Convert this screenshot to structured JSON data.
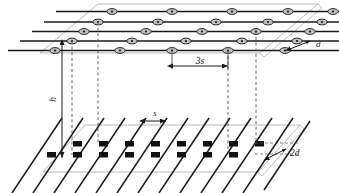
{
  "figure": {
    "type": "technical-line-diagram",
    "width": 339,
    "height": 193,
    "background_color": "#ffffff"
  },
  "labels": {
    "height": "h",
    "upper_spacing": "3s",
    "lower_spacing": "s",
    "upper_thickness": "d",
    "lower_thickness": "2d"
  },
  "colors": {
    "line_dark": "#1a1a1a",
    "line_plane_outline": "#a8a8a8",
    "marker_fill_upper": "#bfbfbf",
    "marker_fill_lower": "#111111",
    "dashed": "#555555"
  },
  "upper_plane": {
    "name": "upper-array-plane",
    "row_count": 5,
    "markers_per_row": [
      5,
      5,
      5,
      5,
      5
    ],
    "marker_shape": "ellipse",
    "marker_total": 25
  },
  "lower_plane": {
    "name": "lower-array-plane",
    "diagonal_line_count": 13,
    "marker_rows": 2,
    "markers_per_row": [
      8,
      8
    ],
    "marker_shape": "square",
    "marker_total": 16
  },
  "connectors": {
    "name": "vertical-dashed-connectors",
    "count": 4
  }
}
